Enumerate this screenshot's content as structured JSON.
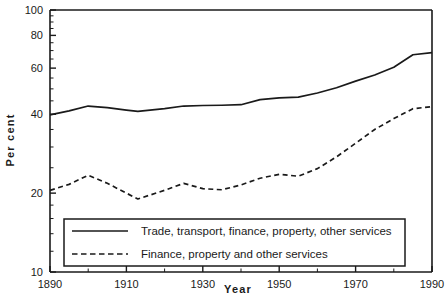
{
  "chart_data": {
    "type": "line",
    "title": "",
    "xlabel": "Year",
    "ylabel": "Per cent",
    "xlim": [
      1890,
      1990
    ],
    "ylim": [
      10,
      100
    ],
    "yscale": "log",
    "grid": false,
    "legend_position": "bottom-center",
    "xticks": [
      1890,
      1910,
      1930,
      1950,
      1970,
      1990
    ],
    "xtick_labels": [
      "1890",
      "1910",
      "1930",
      "1950",
      "1970",
      "1990"
    ],
    "xminor_ticks": [
      1900,
      1920,
      1940,
      1960,
      1980
    ],
    "yticks": [
      10,
      20,
      40,
      60,
      80,
      100
    ],
    "ytick_labels": [
      "10",
      "20",
      "40",
      "60",
      "80",
      "100"
    ],
    "series": [
      {
        "name": "Trade, transport, finance, property, other services",
        "style": "solid",
        "color": "#1a1a1a",
        "x": [
          1890,
          1895,
          1900,
          1905,
          1910,
          1913,
          1920,
          1925,
          1930,
          1935,
          1940,
          1945,
          1950,
          1955,
          1960,
          1965,
          1970,
          1975,
          1980,
          1985,
          1990
        ],
        "values": [
          39.8,
          41.2,
          43.0,
          42.4,
          41.5,
          41.0,
          42.0,
          43.0,
          43.2,
          43.3,
          43.5,
          45.5,
          46.2,
          46.5,
          48.2,
          50.5,
          53.5,
          56.5,
          60.5,
          67.5,
          68.8
        ]
      },
      {
        "name": "Finance, property and other services",
        "style": "dashed",
        "color": "#1a1a1a",
        "x": [
          1890,
          1895,
          1900,
          1905,
          1910,
          1913,
          1920,
          1925,
          1930,
          1935,
          1940,
          1945,
          1950,
          1955,
          1960,
          1965,
          1970,
          1975,
          1980,
          1985,
          1990
        ],
        "values": [
          20.5,
          21.6,
          23.4,
          21.8,
          20.0,
          19.0,
          20.5,
          21.8,
          20.8,
          20.6,
          21.5,
          22.8,
          23.6,
          23.2,
          24.8,
          27.5,
          31.0,
          35.0,
          38.5,
          42.0,
          42.8
        ]
      }
    ],
    "legend": [
      {
        "label": "Trade, transport, finance, property, other services",
        "style": "solid"
      },
      {
        "label": "Finance, property and other services",
        "style": "dashed"
      }
    ]
  }
}
